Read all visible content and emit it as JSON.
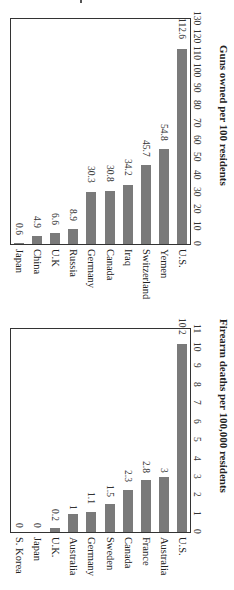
{
  "chart_data": [
    {
      "type": "bar",
      "orientation": "vertical (page rotated 90° clockwise)",
      "title": "",
      "xlabel": "",
      "ylabel": "Guns owned per 100 residents",
      "categories": [
        "Japan",
        "China",
        "U.K",
        "Russia",
        "Germany",
        "Canada",
        "Iraq",
        "Switzerland",
        "Yemen",
        "U.S."
      ],
      "values": [
        0.6,
        4.9,
        6.6,
        8.9,
        30.3,
        30.8,
        34.2,
        45.7,
        54.8,
        112.6
      ],
      "value_labels": [
        "0.6",
        "4.9",
        "6.6",
        "8.9",
        "30.3",
        "30.8",
        "34.2",
        "45.7",
        "54.8",
        "112.6"
      ],
      "ylim": [
        0,
        130
      ],
      "ticks": [
        "0",
        "10",
        "20",
        "30",
        "40",
        "50",
        "60",
        "70",
        "80",
        "90",
        "100",
        "110",
        "120",
        "130"
      ],
      "grid": false,
      "bar_color": "#7a7a7a"
    },
    {
      "type": "bar",
      "orientation": "vertical (page rotated 90° clockwise)",
      "title": "",
      "xlabel": "",
      "ylabel": "Firearm deaths per 100,000 residents",
      "categories": [
        "S. Korea",
        "Japan",
        "U.K.",
        "Australia",
        "Germany",
        "Sweden",
        "Canada",
        "France",
        "Australia",
        "U.S."
      ],
      "values": [
        0,
        0,
        0.2,
        1,
        1.1,
        1.5,
        2.3,
        2.8,
        3,
        10.2
      ],
      "value_labels": [
        "0",
        "0",
        "0.2",
        "1",
        "1.1",
        "1.5",
        "2.3",
        "2.8",
        "3",
        "10.2"
      ],
      "ylim": [
        0,
        11
      ],
      "ticks": [
        "0",
        "1",
        "2",
        "3",
        "4",
        "5",
        "6",
        "7",
        "8",
        "9",
        "10",
        "11"
      ],
      "grid": false,
      "bar_color": "#7a7a7a"
    }
  ]
}
